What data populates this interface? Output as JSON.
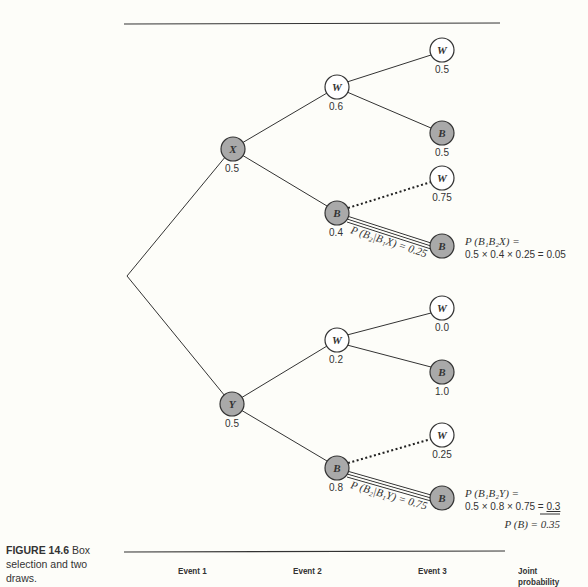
{
  "caption": {
    "figure_label": "FIGURE 14.6",
    "text": "Box selection and two draws."
  },
  "columns": [
    "Event 1",
    "Event 2",
    "Event 3",
    "Joint probability"
  ],
  "tree": {
    "level1": [
      {
        "id": "X",
        "label": "X",
        "prob": "0.5",
        "shaded": true
      },
      {
        "id": "Y",
        "label": "Y",
        "prob": "0.5",
        "shaded": true
      }
    ],
    "level2": [
      {
        "parent": "X",
        "label": "W",
        "prob": "0.6",
        "shaded": false
      },
      {
        "parent": "X",
        "label": "B",
        "prob": "0.4",
        "shaded": true
      },
      {
        "parent": "Y",
        "label": "W",
        "prob": "0.2",
        "shaded": false
      },
      {
        "parent": "Y",
        "label": "B",
        "prob": "0.8",
        "shaded": true
      }
    ],
    "level3": [
      {
        "parent": "XW",
        "label": "W",
        "prob": "0.5",
        "shaded": false
      },
      {
        "parent": "XW",
        "label": "B",
        "prob": "0.5",
        "shaded": true
      },
      {
        "parent": "XB",
        "label": "W",
        "prob": "0.75",
        "shaded": false,
        "edge": "dotted"
      },
      {
        "parent": "XB",
        "label": "B",
        "prob": "",
        "shaded": true,
        "edge": "double"
      },
      {
        "parent": "YW",
        "label": "W",
        "prob": "0.0",
        "shaded": false
      },
      {
        "parent": "YW",
        "label": "B",
        "prob": "1.0",
        "shaded": true
      },
      {
        "parent": "YB",
        "label": "W",
        "prob": "0.25",
        "shaded": false,
        "edge": "dotted"
      },
      {
        "parent": "YB",
        "label": "B",
        "prob": "",
        "shaded": true,
        "edge": "double"
      }
    ]
  },
  "edge_labels": {
    "xb_b": "P (B₂|B₁X) = 0.25",
    "yb_b": "P (B₂|B₁Y) = 0.75"
  },
  "joint": {
    "x_line1": "P (B₁B₂X) =",
    "x_line2": "0.5 × 0.4 × 0.25 = 0.05",
    "y_line1": "P (B₁B₂Y) =",
    "y_line2_prefix": "0.5 × 0.8 × 0.75 = ",
    "y_line2_value": "0.3",
    "total": "P (B) = 0.35"
  },
  "colors": {
    "shaded_fill": "#a9a9a9",
    "stroke": "#333333",
    "background": "#fdfdf9"
  }
}
